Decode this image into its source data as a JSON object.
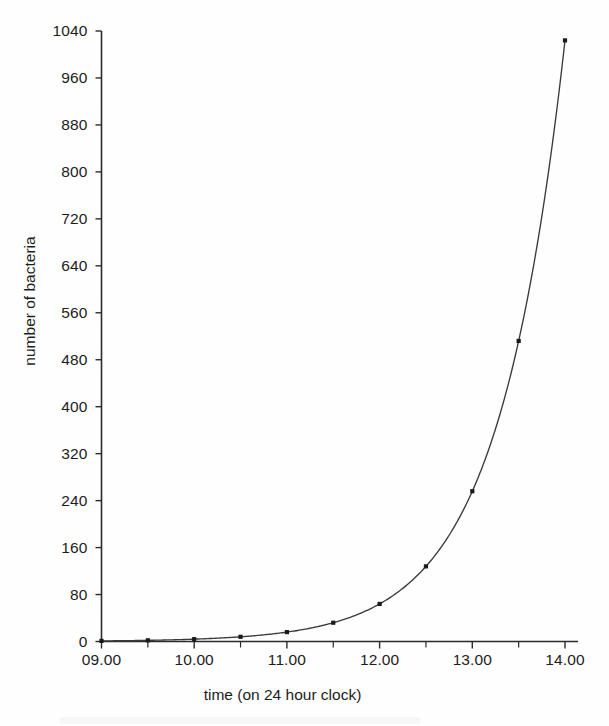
{
  "chart_data": {
    "type": "line",
    "title": "",
    "xlabel": "time (on 24 hour clock)",
    "ylabel": "number of bacteria",
    "grid": false,
    "legend": "none",
    "x_tick_labels": [
      "09.00",
      "10.00",
      "11.00",
      "12.00",
      "13.00",
      "14.00"
    ],
    "x_tick_values": [
      9,
      10,
      11,
      12,
      13,
      14
    ],
    "x_minor_tick_values": [
      9.5,
      10.5,
      11.5,
      12.5,
      13.5
    ],
    "xlim": [
      9,
      14
    ],
    "y_tick_labels": [
      "0",
      "80",
      "160",
      "240",
      "320",
      "400",
      "480",
      "560",
      "640",
      "720",
      "800",
      "880",
      "960",
      "1040"
    ],
    "y_tick_values": [
      0,
      80,
      160,
      240,
      320,
      400,
      480,
      560,
      640,
      720,
      800,
      880,
      960,
      1040
    ],
    "ylim": [
      0,
      1040
    ],
    "series": [
      {
        "name": "number of bacteria",
        "marker": "square",
        "marker_color": "#1a1a1a",
        "line_color": "#3a3a3a",
        "x": [
          9,
          9.5,
          10,
          10.5,
          11,
          11.5,
          12,
          12.5,
          13,
          13.5,
          14
        ],
        "y": [
          1,
          2,
          4,
          8,
          16,
          32,
          64,
          128,
          256,
          512,
          1024
        ],
        "x_time_labels": [
          "09.00",
          "09.30",
          "10.00",
          "10.30",
          "11.00",
          "11.30",
          "12.00",
          "12.30",
          "13.00",
          "13.30",
          "14.00"
        ]
      }
    ]
  },
  "axes": {
    "y_title": "number of bacteria",
    "x_title": "time (on 24 hour clock)",
    "axis_color": "#2b2b2b"
  },
  "y_ticks": [
    {
      "label": "1040",
      "value": 1040
    },
    {
      "label": "960",
      "value": 960
    },
    {
      "label": "880",
      "value": 880
    },
    {
      "label": "800",
      "value": 800
    },
    {
      "label": "720",
      "value": 720
    },
    {
      "label": "640",
      "value": 640
    },
    {
      "label": "560",
      "value": 560
    },
    {
      "label": "480",
      "value": 480
    },
    {
      "label": "400",
      "value": 400
    },
    {
      "label": "320",
      "value": 320
    },
    {
      "label": "240",
      "value": 240
    },
    {
      "label": "160",
      "value": 160
    },
    {
      "label": "80",
      "value": 80
    },
    {
      "label": "0",
      "value": 0
    }
  ],
  "x_ticks": [
    {
      "label": "09.00",
      "value": 9
    },
    {
      "label": "10.00",
      "value": 10
    },
    {
      "label": "11.00",
      "value": 11
    },
    {
      "label": "12.00",
      "value": 12
    },
    {
      "label": "13.00",
      "value": 13
    },
    {
      "label": "14.00",
      "value": 14
    }
  ]
}
